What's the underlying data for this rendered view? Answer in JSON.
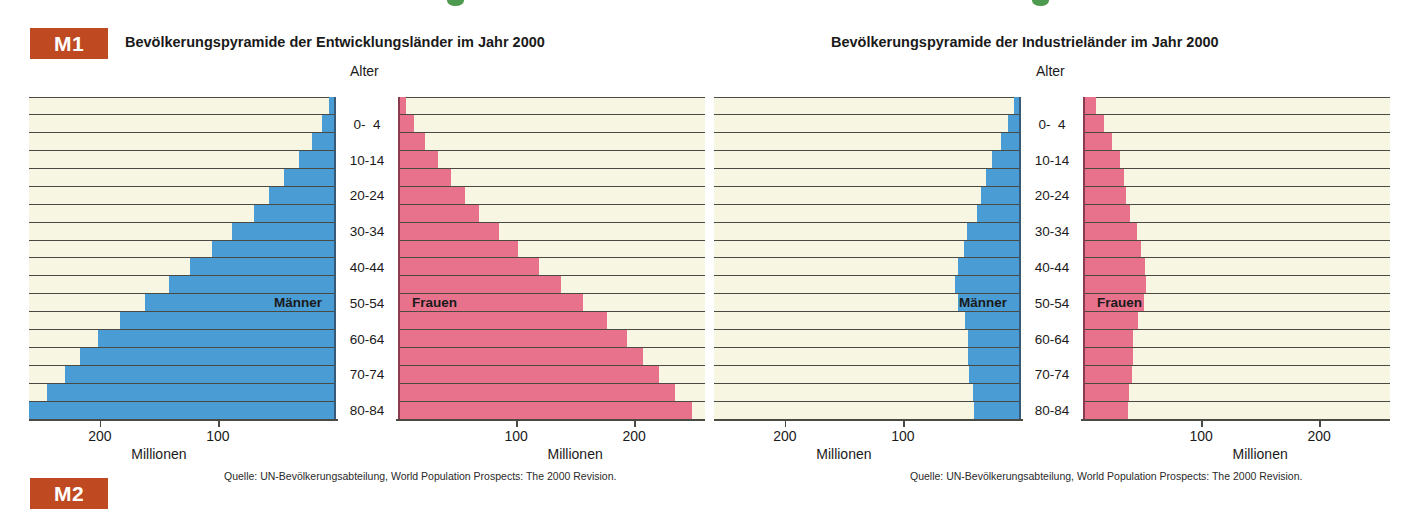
{
  "badges": {
    "m1": "M1",
    "m2": "M2"
  },
  "accent_colors": {
    "badge": "#bf4a21",
    "male_bar": "#4a9dd4",
    "female_bar": "#e8728c",
    "panel_background": "#f7f6e3",
    "gridline": "#4a4a42",
    "green_tick": "#4e9a4e"
  },
  "left_chart": {
    "title": "Bevölkerungspyramide der Entwicklungsländer im Jahr 2000",
    "age_axis_label": "Alter",
    "male_label": "Männer",
    "female_label": "Frauen",
    "unit_label": "Millionen",
    "source": "Quelle: UN-Bevölkerungsabteilung, World Population Prospects: The 2000 Revision."
  },
  "right_chart": {
    "title": "Bevölkerungspyramide der Industrieländer im Jahr 2000",
    "age_axis_label": "Alter",
    "male_label": "Männer",
    "female_label": "Frauen",
    "unit_label": "Millionen",
    "source": "Quelle: UN-Bevölkerungsabteilung, World Population Prospects: The 2000 Revision."
  },
  "age_ticks": [
    "80-84",
    "70-74",
    "60-64",
    "50-54",
    "40-44",
    "30-34",
    "20-24",
    "10-14",
    "0-  4"
  ],
  "axis_ticks": [
    "200",
    "100"
  ],
  "chart_data": [
    {
      "type": "bar",
      "title": "Bevölkerungspyramide der Entwicklungsländer im Jahr 2000",
      "subtype": "population-pyramid",
      "xlabel": "Millionen",
      "ylabel": "Alter",
      "xlim": [
        0,
        260
      ],
      "xticks": [
        100,
        200
      ],
      "grid": true,
      "legend_position": "inside-bars",
      "categories": [
        "0- 4",
        "5- 9",
        "10-14",
        "15-19",
        "20-24",
        "25-29",
        "30-34",
        "35-39",
        "40-44",
        "45-49",
        "50-54",
        "55-59",
        "60-64",
        "65-69",
        "70-74",
        "75-79",
        "80-84",
        "85+"
      ],
      "series": [
        {
          "name": "Männer",
          "color": "#4a9dd4",
          "side": "left",
          "values": [
            258,
            243,
            228,
            215,
            200,
            181,
            160,
            140,
            122,
            103,
            86,
            68,
            55,
            42,
            30,
            19,
            10,
            4
          ]
        },
        {
          "name": "Frauen",
          "color": "#e8728c",
          "side": "right",
          "values": [
            247,
            233,
            219,
            206,
            192,
            175,
            155,
            136,
            118,
            100,
            84,
            67,
            55,
            43,
            32,
            21,
            12,
            5
          ]
        }
      ]
    },
    {
      "type": "bar",
      "title": "Bevölkerungspyramide der Industrieländer im Jahr 2000",
      "subtype": "population-pyramid",
      "xlabel": "Millionen",
      "ylabel": "Alter",
      "xlim": [
        0,
        260
      ],
      "xticks": [
        100,
        200
      ],
      "grid": true,
      "legend_position": "inside-bars",
      "categories": [
        "0- 4",
        "5- 9",
        "10-14",
        "15-19",
        "20-24",
        "25-29",
        "30-34",
        "35-39",
        "40-44",
        "45-49",
        "50-54",
        "55-59",
        "60-64",
        "65-69",
        "70-74",
        "75-79",
        "80-84",
        "85+"
      ],
      "series": [
        {
          "name": "Männer",
          "color": "#4a9dd4",
          "side": "left",
          "values": [
            38,
            39,
            42,
            43,
            43,
            46,
            52,
            54,
            52,
            47,
            44,
            36,
            32,
            28,
            23,
            15,
            9,
            4
          ]
        },
        {
          "name": "Frauen",
          "color": "#e8728c",
          "side": "right",
          "values": [
            36,
            37,
            40,
            41,
            41,
            45,
            50,
            52,
            51,
            47,
            44,
            38,
            35,
            33,
            30,
            23,
            16,
            9
          ]
        }
      ]
    }
  ]
}
